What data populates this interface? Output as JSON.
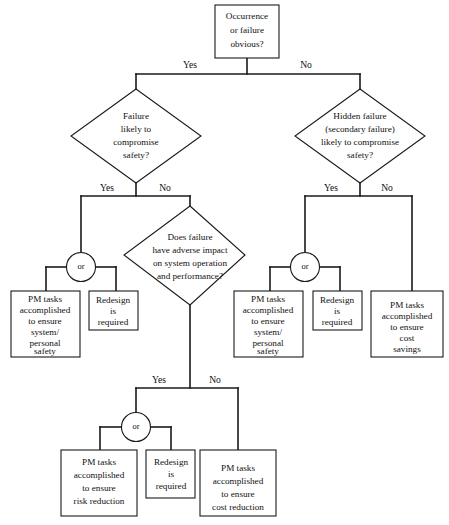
{
  "diagram": {
    "type": "flowchart",
    "colors": {
      "background": "#ffffff",
      "line": "#1a1a1a",
      "text": "#111111",
      "node_fill": "#ffffff"
    }
  },
  "nodes": {
    "start": {
      "shape": "rectangle",
      "lines": [
        "Occurrence",
        "or failure",
        "obvious?"
      ]
    },
    "diamond_left": {
      "shape": "diamond",
      "lines": [
        "Failure",
        "likely to",
        "compromise",
        "safety?"
      ]
    },
    "diamond_right": {
      "shape": "diamond",
      "lines": [
        "Hidden failure",
        "(secondary failure)",
        "likely to compromise",
        "safety?"
      ]
    },
    "diamond_middle": {
      "shape": "diamond",
      "lines": [
        "Does failure",
        "have adverse impact",
        "on system operation",
        "and performance?"
      ]
    },
    "left_pm_safety": {
      "shape": "rectangle",
      "lines": [
        "PM tasks",
        "accomplished",
        "to ensure",
        "system/",
        "personal",
        "safety"
      ]
    },
    "left_redesign": {
      "shape": "rectangle",
      "lines": [
        "Redesign",
        "is",
        "required"
      ]
    },
    "right_pm_safety": {
      "shape": "rectangle",
      "lines": [
        "PM tasks",
        "accomplished",
        "to ensure",
        "system/",
        "personal",
        "safety"
      ]
    },
    "right_redesign": {
      "shape": "rectangle",
      "lines": [
        "Redesign",
        "is",
        "required"
      ]
    },
    "right_pm_cost_savings": {
      "shape": "rectangle",
      "lines": [
        "PM tasks",
        "accomplished",
        "to ensure",
        "cost",
        "savings"
      ]
    },
    "bottom_pm_risk": {
      "shape": "rectangle",
      "lines": [
        "PM  tasks",
        "accomplished",
        "to ensure",
        "risk reduction"
      ]
    },
    "bottom_redesign": {
      "shape": "rectangle",
      "lines": [
        "Redesign",
        "is",
        "required"
      ]
    },
    "bottom_pm_cost": {
      "shape": "rectangle",
      "lines": [
        "PM tasks",
        "accomplished",
        "to ensure",
        "cost  reduction"
      ]
    }
  },
  "or_gates": {
    "left": {
      "label": "or"
    },
    "right": {
      "label": "or"
    },
    "bottom": {
      "label": "or"
    }
  },
  "branch_labels": {
    "start_yes": "Yes",
    "start_no": "No",
    "left_yes": "Yes",
    "left_no": "No",
    "right_yes": "Yes",
    "right_no": "No",
    "middle_yes": "Yes",
    "middle_no": "No"
  },
  "edges": [
    {
      "from": "start",
      "to": "diamond_left",
      "label": "Yes"
    },
    {
      "from": "start",
      "to": "diamond_right",
      "label": "No"
    },
    {
      "from": "diamond_left",
      "to": "or_left",
      "label": "Yes"
    },
    {
      "from": "diamond_left",
      "to": "diamond_middle",
      "label": "No"
    },
    {
      "from": "or_left",
      "to": "left_pm_safety",
      "label": ""
    },
    {
      "from": "or_left",
      "to": "left_redesign",
      "label": ""
    },
    {
      "from": "diamond_right",
      "to": "or_right",
      "label": "Yes"
    },
    {
      "from": "diamond_right",
      "to": "right_pm_cost_savings",
      "label": "No"
    },
    {
      "from": "or_right",
      "to": "right_pm_safety",
      "label": ""
    },
    {
      "from": "or_right",
      "to": "right_redesign",
      "label": ""
    },
    {
      "from": "diamond_middle",
      "to": "or_bottom",
      "label": "Yes"
    },
    {
      "from": "diamond_middle",
      "to": "bottom_pm_cost",
      "label": "No"
    },
    {
      "from": "or_bottom",
      "to": "bottom_pm_risk",
      "label": ""
    },
    {
      "from": "or_bottom",
      "to": "bottom_redesign",
      "label": ""
    }
  ]
}
